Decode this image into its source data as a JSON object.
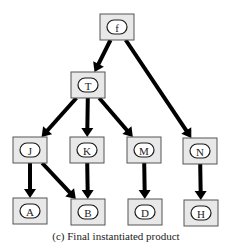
{
  "diagram": {
    "caption": "(c) Final instantiated product",
    "colors": {
      "box_fill": "#e8e8e8",
      "box_border": "#555555",
      "edge": "#000000",
      "text": "#1a1a1a"
    },
    "nodes": [
      {
        "id": "f",
        "label": "f",
        "level": 0
      },
      {
        "id": "T",
        "label": "T",
        "level": 1
      },
      {
        "id": "J",
        "label": "J",
        "level": 2
      },
      {
        "id": "K",
        "label": "K",
        "level": 2
      },
      {
        "id": "M",
        "label": "M",
        "level": 2
      },
      {
        "id": "N",
        "label": "N",
        "level": 2
      },
      {
        "id": "A",
        "label": "A",
        "level": 3
      },
      {
        "id": "B",
        "label": "B",
        "level": 3
      },
      {
        "id": "D",
        "label": "D",
        "level": 3
      },
      {
        "id": "H",
        "label": "H",
        "level": 3
      }
    ],
    "edges": [
      {
        "from": "f",
        "to": "T"
      },
      {
        "from": "f",
        "to": "N"
      },
      {
        "from": "T",
        "to": "J"
      },
      {
        "from": "T",
        "to": "K"
      },
      {
        "from": "T",
        "to": "M"
      },
      {
        "from": "J",
        "to": "A"
      },
      {
        "from": "J",
        "to": "B"
      },
      {
        "from": "K",
        "to": "B"
      },
      {
        "from": "M",
        "to": "D"
      },
      {
        "from": "N",
        "to": "H"
      }
    ]
  }
}
